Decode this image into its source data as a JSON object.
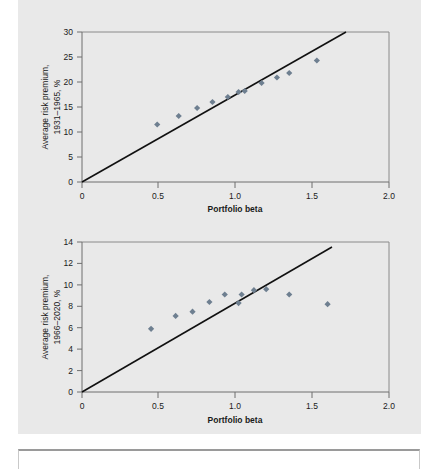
{
  "figure": {
    "background_color": "#e9e9e9",
    "marker_color": "#6e7f90",
    "line_color": "#111111"
  },
  "chart_data": [
    {
      "type": "scatter",
      "title": "",
      "xlabel": "Portfolio beta",
      "ylabel": "Average risk premium, 1931–1965, %",
      "xlim": [
        0,
        2.0
      ],
      "ylim": [
        0,
        30
      ],
      "xticks": [
        0,
        0.5,
        1.0,
        1.5,
        2.0
      ],
      "xticklabels": [
        "0",
        "0.5",
        "1.0",
        "1.5",
        "2.0"
      ],
      "yticks": [
        0,
        5,
        10,
        15,
        20,
        25,
        30
      ],
      "yticklabels": [
        "0",
        "5",
        "10",
        "15",
        "20",
        "25",
        "30"
      ],
      "grid": false,
      "legend": "none",
      "x": [
        0.49,
        0.63,
        0.75,
        0.85,
        0.95,
        1.02,
        1.06,
        1.17,
        1.27,
        1.35,
        1.53
      ],
      "y": [
        11.5,
        13.2,
        14.8,
        16.0,
        17.0,
        18.0,
        18.2,
        19.8,
        20.9,
        21.8,
        24.3
      ],
      "fit_line": {
        "label": "Market line",
        "x0": 0.0,
        "y0": 0.0,
        "x1": 1.72,
        "y1": 30.0,
        "slope": 17.4,
        "intercept": 0.0
      },
      "annotations": []
    },
    {
      "type": "scatter",
      "title": "",
      "xlabel": "Portfolio beta",
      "ylabel": "Average risk premium, 1966–2020, %",
      "xlim": [
        0,
        2.0
      ],
      "ylim": [
        0,
        14
      ],
      "xticks": [
        0,
        0.5,
        1.0,
        1.5,
        2.0
      ],
      "xticklabels": [
        "0",
        "0.5",
        "1.0",
        "1.5",
        "2.0"
      ],
      "yticks": [
        0,
        2,
        4,
        6,
        8,
        10,
        12,
        14
      ],
      "yticklabels": [
        "0",
        "2",
        "4",
        "6",
        "8",
        "10",
        "12",
        "14"
      ],
      "grid": false,
      "legend": "none",
      "x": [
        0.45,
        0.61,
        0.72,
        0.83,
        0.93,
        1.02,
        1.04,
        1.12,
        1.2,
        1.35,
        1.6
      ],
      "y": [
        5.9,
        7.1,
        7.5,
        8.4,
        9.1,
        8.3,
        9.1,
        9.5,
        9.6,
        9.1,
        8.2
      ],
      "fit_line": {
        "label": "Market line",
        "x0": 0.0,
        "y0": 0.0,
        "x1": 1.63,
        "y1": 13.5,
        "slope": 8.28,
        "intercept": 0.0
      },
      "annotations": []
    }
  ]
}
